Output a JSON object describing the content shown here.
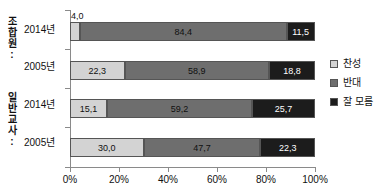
{
  "chart_data": {
    "type": "bar",
    "subtype": "horizontal-stacked-100",
    "title": "",
    "xlabel": "",
    "ylabel": "",
    "xlim": [
      0,
      100
    ],
    "grid": false,
    "legend_position": "right",
    "categories": [
      "2014년",
      "2005년",
      "2014년",
      "2005년"
    ],
    "series": [
      {
        "name": "찬성",
        "color": "#d3d3d3",
        "values": [
          4.0,
          22.3,
          15.1,
          30.0
        ]
      },
      {
        "name": "반대",
        "color": "#6e6e6e",
        "values": [
          84.4,
          58.9,
          59.2,
          47.7
        ]
      },
      {
        "name": "잘 모름",
        "color": "#1c1c1c",
        "values": [
          11.5,
          18.8,
          25.7,
          22.3
        ]
      }
    ],
    "xticks": [
      0,
      20,
      40,
      60,
      80,
      100
    ],
    "xtick_labels": [
      "0%",
      "20%",
      "40%",
      "60%",
      "80%",
      "100%"
    ]
  },
  "groups": [
    {
      "name": "group-union",
      "label_chars": [
        "조",
        "합",
        "원",
        ":"
      ]
    },
    {
      "name": "group-teacher",
      "label_chars": [
        "일",
        "반",
        "교",
        "사",
        ":"
      ]
    }
  ],
  "bars": [
    {
      "year": "2014년",
      "segments": [
        {
          "series": "찬성",
          "value": 4.0,
          "label": "4,0",
          "label_outside": true
        },
        {
          "series": "반대",
          "value": 84.4,
          "label": "84,4",
          "label_outside": false
        },
        {
          "series": "잘 모름",
          "value": 11.5,
          "label": "11,5",
          "label_outside": false
        }
      ]
    },
    {
      "year": "2005년",
      "segments": [
        {
          "series": "찬성",
          "value": 22.3,
          "label": "22,3",
          "label_outside": false
        },
        {
          "series": "반대",
          "value": 58.9,
          "label": "58,9",
          "label_outside": false
        },
        {
          "series": "잘 모름",
          "value": 18.8,
          "label": "18,8",
          "label_outside": false
        }
      ]
    },
    {
      "year": "2014년",
      "segments": [
        {
          "series": "찬성",
          "value": 15.1,
          "label": "15,1",
          "label_outside": false
        },
        {
          "series": "반대",
          "value": 59.2,
          "label": "59,2",
          "label_outside": false
        },
        {
          "series": "잘 모름",
          "value": 25.7,
          "label": "25,7",
          "label_outside": false
        }
      ]
    },
    {
      "year": "2005년",
      "segments": [
        {
          "series": "찬성",
          "value": 30.0,
          "label": "30,0",
          "label_outside": false
        },
        {
          "series": "반대",
          "value": 47.7,
          "label": "47,7",
          "label_outside": false
        },
        {
          "series": "잘 모름",
          "value": 22.3,
          "label": "22,3",
          "label_outside": false
        }
      ]
    }
  ],
  "legend": {
    "items": [
      {
        "label": "찬성",
        "color": "#d3d3d3",
        "name": "legend-agree"
      },
      {
        "label": "반대",
        "color": "#6e6e6e",
        "name": "legend-oppose"
      },
      {
        "label": "잘 모름",
        "color": "#1c1c1c",
        "name": "legend-unknown"
      }
    ]
  },
  "axis": {
    "x_tick_labels": [
      "0%",
      "20%",
      "40%",
      "60%",
      "80%",
      "100%"
    ]
  }
}
